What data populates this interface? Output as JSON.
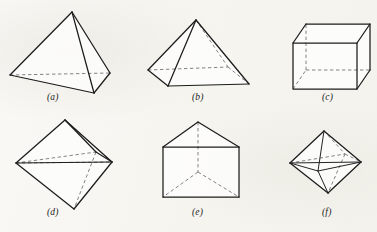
{
  "page": {
    "background_color": "#f7f6f2",
    "ink_color": "#1c1c1c",
    "hidden_edge_color": "#6d6d6d",
    "width": 377,
    "height": 232,
    "kind": "textbook-figure-plate"
  },
  "figures": [
    {
      "id": "a",
      "caption": "(a)",
      "name": "tetrahedron",
      "label": "Tetrahedron",
      "row": 1,
      "column": 1,
      "faces": 4,
      "vertices": 4,
      "edges": 6,
      "hidden_edges": 1,
      "geometry": {
        "points": {
          "apex": [
            72,
            12
          ],
          "left": [
            10,
            75
          ],
          "front": [
            94,
            93
          ],
          "right": [
            110,
            73
          ]
        },
        "solid_paths": [
          "M72,12 L10,75",
          "M72,12 L94,93",
          "M72,12 L110,73",
          "M10,75 L94,93",
          "M94,93 L110,73"
        ],
        "hidden_paths": [
          "M10,75 L110,73"
        ]
      }
    },
    {
      "id": "b",
      "caption": "(b)",
      "name": "square-pyramid",
      "label": "Square pyramid",
      "row": 1,
      "column": 2,
      "faces": 5,
      "vertices": 5,
      "edges": 8,
      "hidden_edges": 3,
      "geometry": {
        "points": {
          "apex": [
            196,
            20
          ],
          "left": [
            148,
            70
          ],
          "front": [
            168,
            86
          ],
          "right": [
            249,
            84
          ],
          "back": [
            228,
            67
          ]
        },
        "solid_paths": [
          "M196,20 L148,70",
          "M196,20 L168,86",
          "M196,20 L249,84",
          "M148,70 L168,86",
          "M168,86 L249,84"
        ],
        "hidden_paths": [
          "M196,20 L228,67",
          "M148,70 L228,67",
          "M228,67 L249,84"
        ]
      }
    },
    {
      "id": "c",
      "caption": "(c)",
      "name": "cube",
      "label": "Cube",
      "row": 1,
      "column": 3,
      "faces": 6,
      "vertices": 8,
      "edges": 12,
      "hidden_edges": 3,
      "geometry": {
        "points": {
          "front_top_left": [
            293,
            43
          ],
          "front_top_right": [
            357,
            43
          ],
          "front_bottom_right": [
            357,
            89
          ],
          "front_bottom_left": [
            293,
            89
          ],
          "back_top_left": [
            306,
            24
          ],
          "back_top_right": [
            370,
            24
          ],
          "back_bottom_right": [
            370,
            70
          ],
          "back_bottom_left": [
            306,
            70
          ]
        },
        "solid_paths": [
          "M293,43 L357,43 L357,89 L293,89 Z",
          "M306,24 L370,24 L370,70",
          "M293,43 L306,24",
          "M357,43 L370,24",
          "M357,89 L370,70"
        ],
        "hidden_paths": [
          "M293,89 L306,70",
          "M306,70 L306,24",
          "M306,70 L370,70"
        ]
      }
    },
    {
      "id": "d",
      "caption": "(d)",
      "name": "octahedron",
      "label": "Octahedron",
      "row": 2,
      "column": 1,
      "faces": 8,
      "vertices": 6,
      "edges": 12,
      "hidden_edges": 4,
      "geometry": {
        "points": {
          "top": [
            65,
            120
          ],
          "left": [
            16,
            163
          ],
          "right": [
            112,
            162
          ],
          "bottom": [
            74,
            209
          ],
          "front": [
            62,
            168
          ],
          "back": [
            96,
            152
          ]
        },
        "solid_paths": [
          "M65,120 L16,163",
          "M65,120 L112,162",
          "M16,163 L74,209",
          "M112,162 L74,209",
          "M16,163 L112,162",
          "M65,120 L96,152",
          "M96,152 L112,162"
        ],
        "hidden_paths": [
          "M16,163 L96,152",
          "M96,152 L74,209",
          "M65,120 L112,162",
          "M16,163 L112,162"
        ]
      }
    },
    {
      "id": "e",
      "caption": "(e)",
      "name": "triangular-prism",
      "label": "Triangular prism",
      "row": 2,
      "column": 2,
      "faces": 5,
      "vertices": 6,
      "edges": 9,
      "hidden_edges": 3,
      "geometry": {
        "points": {
          "apex_front": [
            198,
            122
          ],
          "rect_top_left": [
            163,
            147
          ],
          "rect_top_right": [
            239,
            147
          ],
          "rect_bottom_right": [
            239,
            197
          ],
          "rect_bottom_left": [
            163,
            197
          ],
          "hidden_center": [
            198,
            172
          ]
        },
        "solid_paths": [
          "M198,122 L163,147",
          "M198,122 L239,147",
          "M163,147 L239,147",
          "M163,147 L163,197",
          "M239,147 L239,197",
          "M163,197 L239,197"
        ],
        "hidden_paths": [
          "M198,122 L198,172",
          "M198,172 L163,197",
          "M198,172 L239,197"
        ]
      }
    },
    {
      "id": "f",
      "caption": "(f)",
      "name": "octahedron-small",
      "label": "Octahedron",
      "row": 2,
      "column": 3,
      "faces": 8,
      "vertices": 6,
      "edges": 12,
      "hidden_edges": 4,
      "geometry": {
        "points": {
          "top": [
            324,
            131
          ],
          "left": [
            290,
            163
          ],
          "right": [
            361,
            162
          ],
          "bottom": [
            328,
            193
          ],
          "front": [
            318,
            171
          ],
          "back": [
            345,
            154
          ]
        },
        "solid_paths": [
          "M324,131 L290,163",
          "M324,131 L361,162",
          "M290,163 L328,193",
          "M361,162 L328,193",
          "M290,163 L361,162",
          "M324,131 L318,171",
          "M318,171 L290,163",
          "M318,171 L361,162",
          "M318,171 L328,193"
        ],
        "hidden_paths": [
          "M324,131 L345,154",
          "M290,163 L345,154",
          "M345,154 L361,162",
          "M345,154 L328,193"
        ]
      }
    }
  ]
}
